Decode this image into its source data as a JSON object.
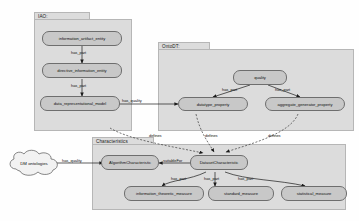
{
  "diagram": {
    "type": "ontology-graph",
    "groups": [
      {
        "id": "iao",
        "label": "IAO:"
      },
      {
        "id": "ontodt",
        "label": "OntoDT:"
      },
      {
        "id": "charact",
        "label": "Characteristics"
      }
    ],
    "nodes": [
      {
        "id": "information_artifact_entity",
        "label": "information_artifact_entity",
        "group": "iao"
      },
      {
        "id": "directive_information_entity",
        "label": "directive_information_entity",
        "group": "iao"
      },
      {
        "id": "data_representational_model",
        "label": "data_representational_model",
        "group": "iao"
      },
      {
        "id": "quality",
        "label": "quality",
        "group": "ontodt"
      },
      {
        "id": "datatype_property",
        "label": "datatype_property",
        "group": "ontodt"
      },
      {
        "id": "aggregate_generator_property",
        "label": "aggregate_generator_property",
        "group": "ontodt"
      },
      {
        "id": "AlgorithmCharacteristic",
        "label": "AlgorithmCharacteristic",
        "group": "charact"
      },
      {
        "id": "DatasetCharacteristic",
        "label": "DatasetCharacteristic",
        "group": "charact"
      },
      {
        "id": "information_theoretic_measure",
        "label": "information_theoretic_measure",
        "group": "charact"
      },
      {
        "id": "standard_measure",
        "label": "standard_measure",
        "group": "charact"
      },
      {
        "id": "statistical_measure",
        "label": "statistical_measure",
        "group": "charact"
      }
    ],
    "cloud": {
      "id": "dm_ontologies",
      "label": "DM ontologies"
    },
    "edges": [
      {
        "from": "information_artifact_entity",
        "to": "directive_information_entity",
        "label": "has_part"
      },
      {
        "from": "directive_information_entity",
        "to": "data_representational_model",
        "label": "has_part"
      },
      {
        "from": "data_representational_model",
        "to": "datatype_property",
        "label": "has_quality"
      },
      {
        "from": "quality",
        "to": "datatype_property",
        "label": "has_part"
      },
      {
        "from": "quality",
        "to": "aggregate_generator_property",
        "label": "has_part"
      },
      {
        "from": "datatype_property",
        "to": "DatasetCharacteristic",
        "label": "defines"
      },
      {
        "from": "aggregate_generator_property",
        "to": "DatasetCharacteristic",
        "label": "defines"
      },
      {
        "from": "data_representational_model",
        "to": "DatasetCharacteristic",
        "label": "defines"
      },
      {
        "from": "dm_ontologies",
        "to": "AlgorithmCharacteristic",
        "label": "has_quality"
      },
      {
        "from": "DatasetCharacteristic",
        "to": "AlgorithmCharacteristic",
        "label": "suitableFor"
      },
      {
        "from": "DatasetCharacteristic",
        "to": "information_theoretic_measure",
        "label": "has_part"
      },
      {
        "from": "DatasetCharacteristic",
        "to": "standard_measure",
        "label": "has_part"
      },
      {
        "from": "DatasetCharacteristic",
        "to": "statistical_measure",
        "label": "has_part"
      }
    ],
    "colors": {
      "group_fill": "#dcdcdc",
      "group_stroke": "#b6b6b6",
      "node_fill": "#c8c8c8",
      "node_stroke": "#6e6e6e",
      "edge": "#1a1a1a",
      "background": "#fefefe"
    }
  }
}
